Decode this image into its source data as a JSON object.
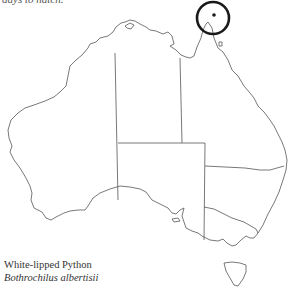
{
  "header": {
    "clipped_text": "days to hatch."
  },
  "map": {
    "region": "Australia",
    "marker": {
      "type": "circle",
      "label": "range-highlight",
      "cx": 213,
      "cy": 18,
      "r": 16,
      "color": "#1a1a1a"
    },
    "occurrence_point": {
      "cx": 214,
      "cy": 15
    }
  },
  "caption": {
    "common_name": "White-lipped Python",
    "scientific_name": "Bothrochilus albertisii"
  }
}
